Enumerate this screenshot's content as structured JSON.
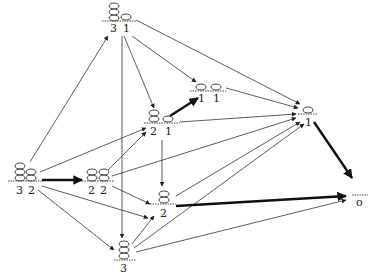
{
  "diagram": {
    "type": "directed-graph",
    "nodes": [
      {
        "id": "n31",
        "stacks": [
          3,
          1
        ],
        "labels": [
          "3",
          "1"
        ],
        "x": 120,
        "y": 20
      },
      {
        "id": "n32",
        "stacks": [
          3,
          2
        ],
        "labels": [
          "3",
          "2"
        ],
        "x": 26,
        "y": 180
      },
      {
        "id": "n22",
        "stacks": [
          2,
          2
        ],
        "labels": [
          "2",
          "2"
        ],
        "x": 98,
        "y": 180
      },
      {
        "id": "n21",
        "stacks": [
          2,
          1
        ],
        "labels": [
          "2",
          "1"
        ],
        "x": 160,
        "y": 126
      },
      {
        "id": "n11",
        "stacks": [
          1,
          1
        ],
        "labels": [
          "1",
          "1"
        ],
        "x": 206,
        "y": 94
      },
      {
        "id": "n1",
        "stacks": [
          1
        ],
        "labels": [
          "1"
        ],
        "x": 310,
        "y": 113
      },
      {
        "id": "n2",
        "stacks": [
          2
        ],
        "labels": [
          "2"
        ],
        "x": 162,
        "y": 200
      },
      {
        "id": "n3",
        "stacks": [
          3
        ],
        "labels": [
          "3"
        ],
        "x": 124,
        "y": 255
      },
      {
        "id": "n0",
        "stacks": [],
        "labels": [
          "o"
        ],
        "x": 360,
        "y": 198
      }
    ],
    "edges": [
      {
        "from": "n32",
        "to": "n31",
        "bold": false
      },
      {
        "from": "n32",
        "to": "n22",
        "bold": true
      },
      {
        "from": "n32",
        "to": "n2",
        "bold": false
      },
      {
        "from": "n32",
        "to": "n3",
        "bold": false
      },
      {
        "from": "n32",
        "to": "n21",
        "bold": false
      },
      {
        "from": "n31",
        "to": "n21",
        "bold": false
      },
      {
        "from": "n31",
        "to": "n11",
        "bold": false
      },
      {
        "from": "n31",
        "to": "n1",
        "bold": false
      },
      {
        "from": "n31",
        "to": "n3",
        "bold": false
      },
      {
        "from": "n22",
        "to": "n21",
        "bold": false
      },
      {
        "from": "n22",
        "to": "n2",
        "bold": false
      },
      {
        "from": "n22",
        "to": "n1",
        "bold": false
      },
      {
        "from": "n21",
        "to": "n11",
        "bold": true
      },
      {
        "from": "n21",
        "to": "n1",
        "bold": false
      },
      {
        "from": "n21",
        "to": "n2",
        "bold": false
      },
      {
        "from": "n11",
        "to": "n1",
        "bold": false
      },
      {
        "from": "n2",
        "to": "n0",
        "bold": true
      },
      {
        "from": "n2",
        "to": "n1",
        "bold": false
      },
      {
        "from": "n3",
        "to": "n2",
        "bold": false
      },
      {
        "from": "n3",
        "to": "n1",
        "bold": false
      },
      {
        "from": "n3",
        "to": "n0",
        "bold": false
      },
      {
        "from": "n1",
        "to": "n0",
        "bold": true
      }
    ]
  },
  "labels": {
    "n31_a": "3",
    "n31_b": "1",
    "n32_a": "3",
    "n32_b": "2",
    "n22_a": "2",
    "n22_b": "2",
    "n21_a": "2",
    "n21_b": "1",
    "n11_a": "1",
    "n11_b": "1",
    "n1_a": "1",
    "n2_a": "2",
    "n3_a": "3",
    "n0_a": "o"
  }
}
